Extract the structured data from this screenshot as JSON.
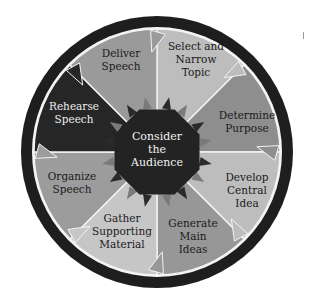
{
  "diagram": {
    "center": {
      "lines": [
        "Consider",
        "the",
        "Audience"
      ],
      "fill": "#232323",
      "text_color": "#f2f2f2"
    },
    "segments": [
      {
        "id": "select-topic",
        "lines": [
          "Select and",
          "Narrow",
          "Topic"
        ],
        "fill": "#bdbdbd",
        "text_color": "#1a1a1a",
        "label_x": 196,
        "label_y": 50
      },
      {
        "id": "determine-purpose",
        "lines": [
          "Determine",
          "Purpose"
        ],
        "fill": "#8e8e8e",
        "text_color": "#1a1a1a",
        "label_x": 247,
        "label_y": 119
      },
      {
        "id": "develop-central-idea",
        "lines": [
          "Develop",
          "Central",
          "Idea"
        ],
        "fill": "#bdbdbd",
        "text_color": "#1a1a1a",
        "label_x": 247,
        "label_y": 181
      },
      {
        "id": "generate-main-ideas",
        "lines": [
          "Generate",
          "Main",
          "Ideas"
        ],
        "fill": "#979797",
        "text_color": "#1a1a1a",
        "label_x": 193,
        "label_y": 227
      },
      {
        "id": "gather-supporting-material",
        "lines": [
          "Gather",
          "Supporting",
          "Material"
        ],
        "fill": "#c6c6c6",
        "text_color": "#1a1a1a",
        "label_x": 122,
        "label_y": 222
      },
      {
        "id": "organize-speech",
        "lines": [
          "Organize",
          "Speech"
        ],
        "fill": "#9c9c9c",
        "text_color": "#1a1a1a",
        "label_x": 72,
        "label_y": 180
      },
      {
        "id": "rehearse-speech",
        "lines": [
          "Rehearse",
          "Speech"
        ],
        "fill": "#262626",
        "text_color": "#ededed",
        "label_x": 74,
        "label_y": 110
      },
      {
        "id": "deliver-speech",
        "lines": [
          "Deliver",
          "Speech"
        ],
        "fill": "#9a9a9a",
        "text_color": "#1a1a1a",
        "label_x": 121,
        "label_y": 57
      }
    ],
    "colors": {
      "outer_ring": "#1e1e1e",
      "inner_ring": "#f4f4f4",
      "divider": "#f4f4f4",
      "center_arrows_dark": "#2a2a2a",
      "center_arrows_light": "#7a7a7a"
    }
  }
}
